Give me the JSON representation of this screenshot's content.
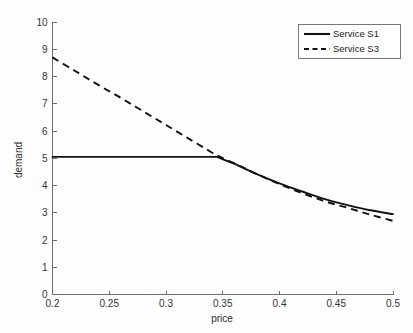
{
  "chart_data": {
    "type": "line",
    "title": "",
    "xlabel": "price",
    "ylabel": "demand",
    "xlim": [
      0.2,
      0.5
    ],
    "ylim": [
      0,
      10
    ],
    "grid": false,
    "legend_position": "top-right",
    "xticks": [
      "0.2",
      "0.25",
      "0.3",
      "0.35",
      "0.4",
      "0.45",
      "0.5"
    ],
    "xtick_values": [
      0.2,
      0.25,
      0.3,
      0.35,
      0.4,
      0.45,
      0.5
    ],
    "yticks": [
      "0",
      "1",
      "2",
      "3",
      "4",
      "5",
      "6",
      "7",
      "8",
      "9",
      "10"
    ],
    "ytick_values": [
      0,
      1,
      2,
      3,
      4,
      5,
      6,
      7,
      8,
      9,
      10
    ],
    "x": [
      0.2,
      0.22,
      0.24,
      0.26,
      0.28,
      0.3,
      0.32,
      0.34,
      0.345,
      0.36,
      0.38,
      0.4,
      0.42,
      0.44,
      0.46,
      0.48,
      0.5
    ],
    "series": [
      {
        "name": "Service S1",
        "style": "solid",
        "color": "#111111",
        "values": [
          5.05,
          5.05,
          5.05,
          5.05,
          5.05,
          5.05,
          5.05,
          5.05,
          5.05,
          4.8,
          4.42,
          4.08,
          3.78,
          3.5,
          3.28,
          3.09,
          2.95
        ]
      },
      {
        "name": "Service S3",
        "style": "dashed",
        "color": "#111111",
        "values": [
          8.7,
          8.2,
          7.7,
          7.22,
          6.72,
          6.22,
          5.72,
          5.22,
          5.1,
          4.82,
          4.42,
          4.05,
          3.72,
          3.42,
          3.18,
          2.93,
          2.7
        ]
      }
    ],
    "annotations": [
      {
        "label": "curve-crossing",
        "x": 0.31,
        "y": 5.05
      },
      {
        "label": "s1-kink",
        "x": 0.345,
        "y": 5.05
      }
    ]
  },
  "legend": {
    "entries": [
      {
        "label": "Service S1",
        "style": "solid"
      },
      {
        "label": "Service S3",
        "style": "dashed"
      }
    ]
  },
  "axes": {
    "x_title": "price",
    "y_title": "demand"
  }
}
